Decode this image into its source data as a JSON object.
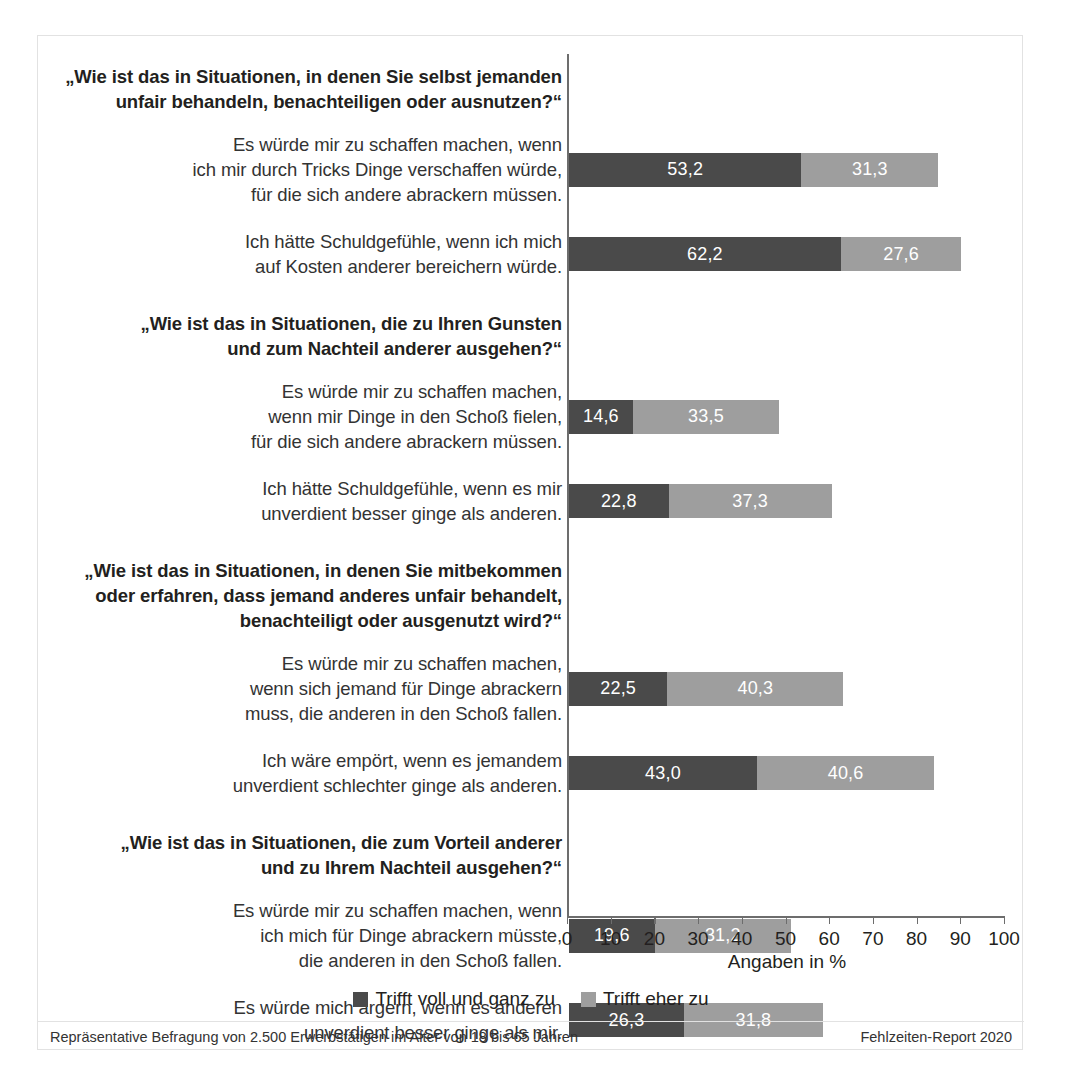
{
  "chart_data": {
    "type": "bar",
    "orientation": "horizontal",
    "stacked": true,
    "title": "",
    "xlabel": "Angaben in %",
    "ylabel": "",
    "xlim": [
      0,
      100
    ],
    "xticks": [
      0,
      10,
      20,
      30,
      40,
      50,
      60,
      70,
      80,
      90,
      100
    ],
    "xtick_labels": [
      "0",
      "10",
      "20",
      "30",
      "40",
      "50",
      "60",
      "70",
      "80",
      "90",
      "100"
    ],
    "grid": false,
    "legend_position": "bottom",
    "series": [
      {
        "name": "Trifft voll und ganz zu",
        "color": "#4a4a4a",
        "values": [
          53.2,
          62.2,
          14.6,
          22.8,
          22.5,
          43.0,
          19.6,
          26.3
        ],
        "value_labels": [
          "53,2",
          "62,2",
          "14,6",
          "22,8",
          "22,5",
          "43,0",
          "19,6",
          "26,3"
        ]
      },
      {
        "name": "Trifft eher zu",
        "color": "#9e9e9e",
        "values": [
          31.3,
          27.6,
          33.5,
          37.3,
          40.3,
          40.6,
          31.2,
          31.8
        ],
        "value_labels": [
          "31,3",
          "27,6",
          "33,5",
          "37,3",
          "40,3",
          "40,6",
          "31,2",
          "31,8"
        ]
      }
    ],
    "categories": [
      "Es würde mir zu schaffen machen, wenn ich mir durch Tricks Dinge verschaffen würde, für die sich andere abrackern müssen.",
      "Ich hätte Schuldgefühle, wenn ich mich auf Kosten anderer bereichern würde.",
      "Es würde mir zu schaffen machen, wenn mir Dinge in den Schoß fielen, für die sich andere abrackern müssen.",
      "Ich hätte Schuldgefühle, wenn es mir unverdient besser ginge als anderen.",
      "Es würde mir zu schaffen machen, wenn sich jemand für Dinge abrackern muss, die anderen in den Schoß fallen.",
      "Ich wäre empört, wenn es jemandem unverdient schlechter ginge als anderen.",
      "Es würde mir zu schaffen machen, wenn ich mich für Dinge abrackern müsste, die anderen in den Schoß fallen.",
      "Es würde mich ärgern, wenn es anderen unverdient besser ginge als mir."
    ],
    "group_headers": [
      "„Wie ist das in Situationen, in denen Sie selbst jemanden unfair behandeln, benachteiligen oder ausnutzen?“",
      "„Wie ist das in Situationen, die zu Ihren Gunsten und zum Nachteil anderer ausgehen?“",
      "„Wie ist das in Situationen, in denen Sie mitbekommen oder erfahren, dass jemand anderes unfair behandelt, benachteiligt oder ausgenutzt wird?“",
      "„Wie ist das in Situationen, die zum Vorteil anderer und zu Ihrem Nachteil ausgehen?“"
    ]
  },
  "groups": [
    {
      "header_lines": [
        "„Wie ist das in Situationen, in denen Sie selbst jemanden",
        "unfair behandeln, benachteiligen oder ausnutzen?“"
      ],
      "rows": [
        {
          "label_lines": [
            "Es würde mir zu schaffen machen, wenn",
            "ich mir durch Tricks Dinge verschaffen würde,",
            "für die sich andere abrackern müssen."
          ],
          "dark_value": "53,2",
          "light_value": "31,3"
        },
        {
          "label_lines": [
            "Ich hätte Schuldgefühle, wenn ich mich",
            "auf Kosten anderer bereichern würde."
          ],
          "dark_value": "62,2",
          "light_value": "27,6"
        }
      ]
    },
    {
      "header_lines": [
        "„Wie ist das in Situationen, die zu Ihren Gunsten",
        "und zum Nachteil anderer ausgehen?“"
      ],
      "rows": [
        {
          "label_lines": [
            "Es würde mir zu schaffen machen,",
            "wenn mir Dinge in den Schoß fielen,",
            "für die sich andere abrackern müssen."
          ],
          "dark_value": "14,6",
          "light_value": "33,5"
        },
        {
          "label_lines": [
            "Ich hätte Schuldgefühle, wenn es mir",
            "unverdient besser ginge als anderen."
          ],
          "dark_value": "22,8",
          "light_value": "37,3"
        }
      ]
    },
    {
      "header_lines": [
        "„Wie ist das in Situationen, in denen Sie mitbekommen",
        "oder erfahren, dass jemand anderes unfair behandelt,",
        "benachteiligt oder ausgenutzt wird?“"
      ],
      "rows": [
        {
          "label_lines": [
            "Es würde mir zu schaffen machen,",
            "wenn sich jemand für Dinge abrackern",
            "muss, die anderen in den Schoß fallen."
          ],
          "dark_value": "22,5",
          "light_value": "40,3"
        },
        {
          "label_lines": [
            "Ich wäre empört, wenn es jemandem",
            "unverdient schlechter ginge als anderen."
          ],
          "dark_value": "43,0",
          "light_value": "40,6"
        }
      ]
    },
    {
      "header_lines": [
        "„Wie ist das in Situationen, die zum Vorteil anderer",
        "und zu Ihrem Nachteil ausgehen?“"
      ],
      "rows": [
        {
          "label_lines": [
            "Es würde mir zu schaffen machen, wenn",
            "ich mich für Dinge abrackern müsste,",
            "die anderen in den Schoß fallen."
          ],
          "dark_value": "19,6",
          "light_value": "31,2"
        },
        {
          "label_lines": [
            "Es würde mich ärgern, wenn es anderen",
            "unverdient besser ginge als mir."
          ],
          "dark_value": "26,3",
          "light_value": "31,8"
        }
      ]
    }
  ],
  "axis": {
    "title": "Angaben in %",
    "ticks": [
      "0",
      "10",
      "20",
      "30",
      "40",
      "50",
      "60",
      "70",
      "80",
      "90",
      "100"
    ]
  },
  "legend": {
    "items": [
      {
        "label": "Trifft voll und ganz zu",
        "color": "#4a4a4a"
      },
      {
        "label": "Trifft eher zu",
        "color": "#9e9e9e"
      }
    ]
  },
  "footer": {
    "left": "Repräsentative Befragung von  2.500 Erwerbstätigen im Alter von 18 bis 65 Jahren",
    "right": "Fehlzeiten-Report 2020"
  },
  "colors": {
    "dark": "#4a4a4a",
    "light": "#9e9e9e",
    "axis": "#6d6d6d",
    "frame": "#e2e2e2",
    "text": "#231f20"
  }
}
